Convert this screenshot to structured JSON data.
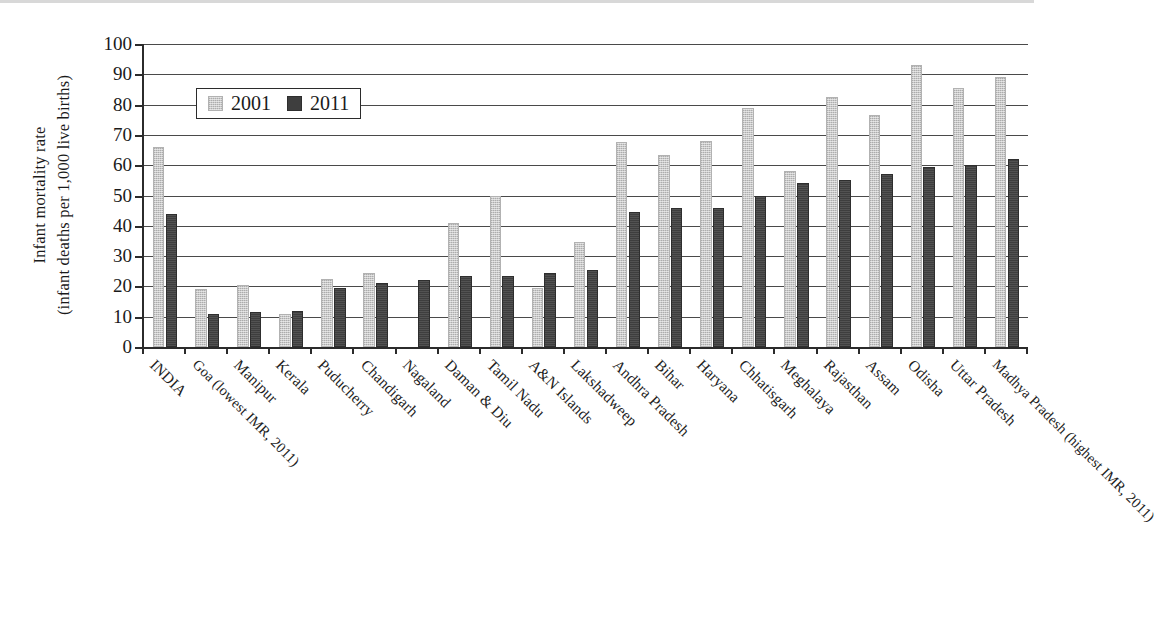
{
  "chart_data": {
    "type": "bar",
    "title": "",
    "xlabel": "",
    "ylabel": "Infant mortality rate\n(infant deaths per 1,000 live births)",
    "ylabel_lines": [
      "Infant mortality rate",
      "(infant deaths per 1,000 live births)"
    ],
    "ylim": [
      0,
      100
    ],
    "yticks": [
      0,
      10,
      20,
      30,
      40,
      50,
      60,
      70,
      80,
      90,
      100
    ],
    "ytick_labels": [
      "0",
      "10",
      "20",
      "30",
      "40",
      "50",
      "60",
      "70",
      "80",
      "90",
      "100"
    ],
    "grid": true,
    "legend_position": "upper-left-inside",
    "categories": [
      "INDIA",
      "Goa (lowest IMR, 2011)",
      "Manipur",
      "Kerala",
      "Puducherry",
      "Chandigarh",
      "Nagaland",
      "Daman & Diu",
      "Tamil Nadu",
      "A&N Islands",
      "Lakshadweep",
      "Andhra Pradesh",
      "Bihar",
      "Haryana",
      "Chhatisgarh",
      "Meghalaya",
      "Rajasthan",
      "Assam",
      "Odisha",
      "Uttar Pradesh",
      "Madhya Pradesh (highest IMR, 2011)"
    ],
    "series": [
      {
        "name": "2001",
        "color": "#c9c9c9",
        "values": [
          66,
          19,
          20.5,
          11,
          22.5,
          24.5,
          null,
          41,
          50,
          19.5,
          34.5,
          67.5,
          63.5,
          68,
          79,
          58,
          82.5,
          76.5,
          93,
          85.5,
          89
        ]
      },
      {
        "name": "2011",
        "color": "#3e3e3e",
        "values": [
          44,
          11,
          11.5,
          12,
          19.5,
          21,
          22,
          23.5,
          23.5,
          24.5,
          25.5,
          44.5,
          46,
          46,
          50,
          54,
          55,
          57,
          59.5,
          60,
          62
        ]
      }
    ]
  },
  "legend": {
    "entries": [
      {
        "label": "2001",
        "swatch": "light-grey-swatch"
      },
      {
        "label": "2011",
        "swatch": "dark-grey-swatch"
      }
    ]
  }
}
